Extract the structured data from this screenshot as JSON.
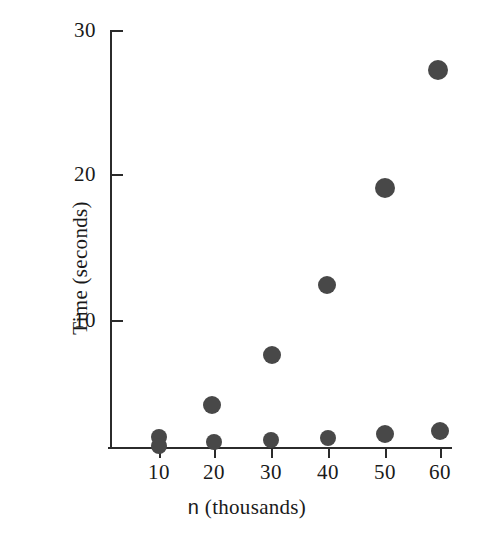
{
  "chart_data": {
    "type": "scatter",
    "title": "",
    "xlabel": "n (thousands)",
    "ylabel": "Time (seconds)",
    "xlabel_variable": "n",
    "xlabel_rest": " (thousands)",
    "x": [
      10,
      20,
      30,
      40,
      50,
      60
    ],
    "xticks": [
      "10",
      "20",
      "30",
      "40",
      "50",
      "60"
    ],
    "yticks": [
      "10",
      "20",
      "30"
    ],
    "ytick_values": [
      10,
      20,
      30
    ],
    "xlim": [
      5,
      65
    ],
    "ylim": [
      0,
      30
    ],
    "grid": false,
    "legend": null,
    "marker": "filled-circle",
    "marker_color": "#484848",
    "axis_color": "#2b2b2b",
    "background": "#ffffff",
    "series": [
      {
        "name": "upper",
        "values": [
          0.9,
          4.1,
          7.6,
          12.3,
          19.1,
          27.4
        ],
        "points": [
          {
            "x": 10,
            "y": 0.9,
            "px": 159,
            "py": 437,
            "r": 8
          },
          {
            "x": 20,
            "y": 4.1,
            "px": 212,
            "py": 405,
            "r": 9
          },
          {
            "x": 30,
            "y": 7.6,
            "px": 272,
            "py": 355,
            "r": 9
          },
          {
            "x": 40,
            "y": 12.3,
            "px": 327,
            "py": 285,
            "r": 9
          },
          {
            "x": 50,
            "y": 19.1,
            "px": 385,
            "py": 188,
            "r": 10
          },
          {
            "x": 60,
            "y": 27.4,
            "px": 438,
            "py": 70,
            "r": 10
          }
        ]
      },
      {
        "name": "lower",
        "values": [
          0.2,
          0.3,
          0.5,
          0.6,
          0.9,
          1.1
        ],
        "points": [
          {
            "x": 10,
            "y": 0.2,
            "px": 159,
            "py": 446,
            "r": 8
          },
          {
            "x": 20,
            "y": 0.3,
            "px": 214,
            "py": 442,
            "r": 8
          },
          {
            "x": 30,
            "y": 0.5,
            "px": 271,
            "py": 440,
            "r": 8
          },
          {
            "x": 40,
            "y": 0.6,
            "px": 328,
            "py": 438,
            "r": 8
          },
          {
            "x": 50,
            "y": 0.9,
            "px": 385,
            "py": 434,
            "r": 9
          },
          {
            "x": 60,
            "y": 1.1,
            "px": 440,
            "py": 431,
            "r": 9
          }
        ]
      }
    ]
  },
  "axes": {
    "y_ticks": [
      {
        "label": "30",
        "py": 30
      },
      {
        "label": "20",
        "py": 174
      },
      {
        "label": "10",
        "py": 320
      }
    ],
    "x_ticks": [
      {
        "label": "10",
        "px": 159
      },
      {
        "label": "20",
        "px": 214
      },
      {
        "label": "30",
        "px": 271
      },
      {
        "label": "40",
        "px": 328
      },
      {
        "label": "50",
        "px": 385
      },
      {
        "label": "60",
        "px": 440
      }
    ]
  }
}
